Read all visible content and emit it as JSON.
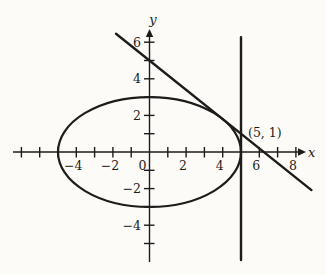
{
  "figure": {
    "background": "#fcfbf8",
    "ink": "#1e1c1a"
  },
  "chart_data": {
    "type": "line",
    "title": "",
    "xlabel": "x",
    "ylabel": "y",
    "xlim": [
      -7.5,
      8.9
    ],
    "ylim": [
      -6.1,
      6.7
    ],
    "grid": false,
    "axes_cross_at": [
      0,
      0
    ],
    "x_ticks": [
      -7,
      -6,
      -5,
      -4,
      -3,
      -2,
      -1,
      1,
      2,
      3,
      4,
      5,
      6,
      7,
      8
    ],
    "x_tick_labels": [
      {
        "value": -4,
        "text": "−4"
      },
      {
        "value": -2,
        "text": "−2"
      },
      {
        "value": 0,
        "text": "0"
      },
      {
        "value": 2,
        "text": "2"
      },
      {
        "value": 4,
        "text": "4"
      },
      {
        "value": 6,
        "text": "6"
      },
      {
        "value": 8,
        "text": "8"
      }
    ],
    "y_ticks": [
      -5,
      -4,
      -3,
      -2,
      -1,
      1,
      2,
      3,
      4,
      5,
      6
    ],
    "y_tick_labels": [
      {
        "value": -4,
        "text": "−4"
      },
      {
        "value": -2,
        "text": "−2"
      },
      {
        "value": 2,
        "text": "2"
      },
      {
        "value": 4,
        "text": "4"
      },
      {
        "value": 6,
        "text": "6"
      }
    ],
    "curves": [
      {
        "name": "ellipse",
        "kind": "ellipse",
        "center": [
          0,
          0
        ],
        "rx": 5,
        "ry": 3
      },
      {
        "name": "tangent-line",
        "kind": "segment",
        "from": [
          -1.83,
          6.46
        ],
        "to": [
          8.85,
          -2.08
        ]
      },
      {
        "name": "vertical-line",
        "kind": "segment",
        "from": [
          5,
          6.28
        ],
        "to": [
          5,
          -5.9
        ]
      }
    ],
    "annotations": [
      {
        "name": "point-label",
        "text": "(5, 1)",
        "anchor": [
          5,
          1
        ],
        "offset_px": [
          7,
          3
        ]
      }
    ]
  }
}
